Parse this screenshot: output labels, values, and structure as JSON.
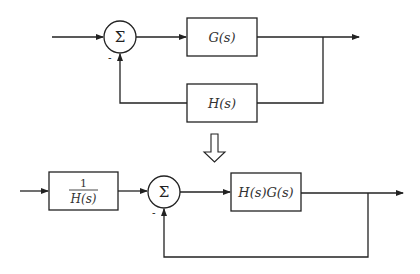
{
  "top_diagram": {
    "summing_junction": {
      "symbol": "Σ",
      "feedback_sign": "-"
    },
    "forward_block": {
      "label": "G(s)"
    },
    "feedback_block": {
      "label": "H(s)"
    }
  },
  "transform_arrow": {
    "icon": "hollow-down-arrow-icon"
  },
  "bottom_diagram": {
    "prefilter_block": {
      "numerator": "1",
      "denominator": "H(s)"
    },
    "summing_junction": {
      "symbol": "Σ",
      "feedback_sign": "-"
    },
    "forward_block": {
      "label": "H(s)G(s)"
    },
    "feedback_path": {
      "label": "unity"
    }
  }
}
